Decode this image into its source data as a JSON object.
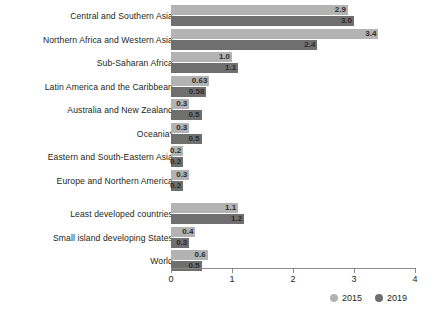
{
  "chart_data": {
    "type": "bar",
    "orientation": "horizontal",
    "title": "",
    "xlabel": "",
    "ylabel": "",
    "xlim": [
      0,
      4
    ],
    "xticks": [
      "0",
      "1",
      "2",
      "3",
      "4"
    ],
    "grid": false,
    "legend_position": "bottom-right",
    "categories": [
      "Central and Southern Asia",
      "Northern Africa and Western Asia",
      "Sub-Saharan Africa",
      "Latin America and the Caribbean",
      "Australia and New Zealand",
      "Oceania*",
      "Eastern and South-Eastern Asia",
      "Europe and Northern America",
      "Least developed countries",
      "Small island developing States",
      "World"
    ],
    "series": [
      {
        "name": "2015",
        "color": "#b3b3b3",
        "values": [
          2.9,
          3.4,
          1.0,
          0.63,
          0.3,
          0.3,
          0.2,
          0.3,
          1.1,
          0.4,
          0.6
        ],
        "labels": [
          "2.9",
          "3.4",
          "1.0",
          "0.63",
          "0.3",
          "0.3",
          "0.2",
          "0.3",
          "1.1",
          "0.4",
          "0.6"
        ]
      },
      {
        "name": "2019",
        "color": "#6f6f6f",
        "values": [
          3.0,
          2.4,
          1.1,
          0.58,
          0.5,
          0.5,
          0.2,
          0.2,
          1.2,
          0.3,
          0.5
        ],
        "labels": [
          "3.0",
          "2.4",
          "1.1",
          "0.58",
          "0.5",
          "0.5",
          "0.2",
          "0.2",
          "1.2",
          "0.3",
          "0.5"
        ]
      }
    ],
    "group_break_after_index": 7
  },
  "legend": {
    "items": [
      {
        "label": "2015",
        "color": "#b3b3b3"
      },
      {
        "label": "2019",
        "color": "#6f6f6f"
      }
    ]
  }
}
